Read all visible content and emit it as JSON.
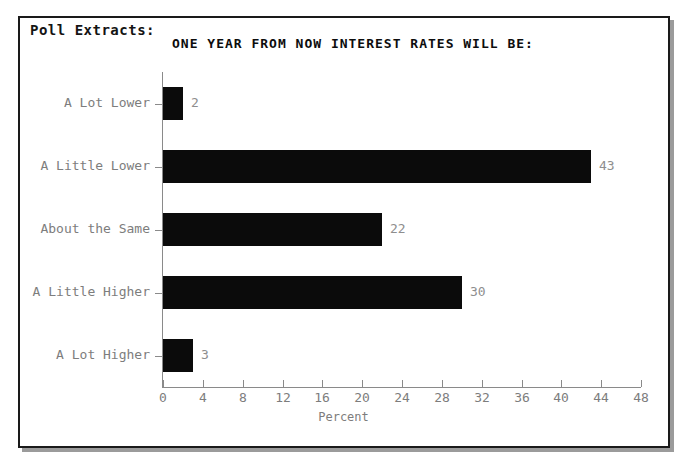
{
  "panel": {
    "extract_label": "Poll Extracts:"
  },
  "chart_data": {
    "type": "bar",
    "orientation": "horizontal",
    "title": "ONE YEAR FROM NOW INTEREST RATES WILL BE:",
    "xlabel": "Percent",
    "ylabel": "",
    "categories": [
      "A Lot Lower",
      "A Little Lower",
      "About the Same",
      "A Little Higher",
      "A Lot Higher"
    ],
    "values": [
      2,
      43,
      22,
      30,
      3
    ],
    "data_labels": [
      "2",
      "43",
      "22",
      "30",
      "3"
    ],
    "xlim": [
      0,
      48
    ],
    "xticks": [
      0,
      4,
      8,
      12,
      16,
      20,
      24,
      28,
      32,
      36,
      40,
      44,
      48
    ],
    "xtick_labels": [
      "0",
      "4",
      "8",
      "12",
      "16",
      "20",
      "24",
      "28",
      "32",
      "36",
      "40",
      "44",
      "48"
    ],
    "grid": false,
    "legend": null,
    "bar_color": "#0b0b0b",
    "axis_color": "#8a8a8a",
    "label_color": "#7d7d7d"
  }
}
